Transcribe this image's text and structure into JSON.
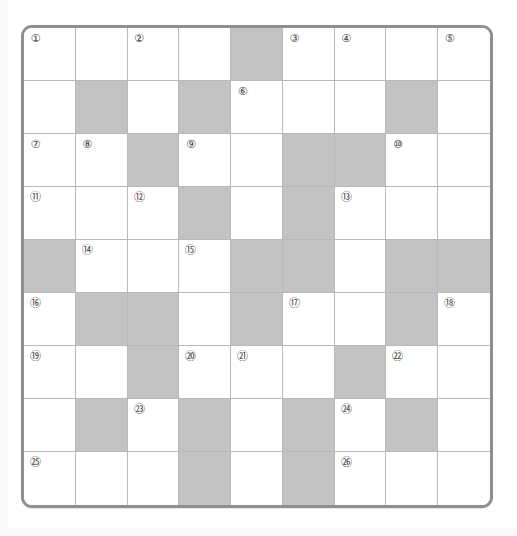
{
  "puzzle": {
    "kind": "crossword-grid",
    "rows": 9,
    "columns": 9,
    "colors": {
      "frame_border": "#8f8f8f",
      "cell_border": "#b9b9b9",
      "open_cell": "#ffffff",
      "blocked_cell": "#c3c3c3",
      "number_text": "#3a3a3a",
      "page_background": "#ffffff"
    },
    "number_style": "circled",
    "highest_clue_number": 26,
    "cells": [
      [
        {
          "state": "open",
          "number": "①"
        },
        {
          "state": "open",
          "number": ""
        },
        {
          "state": "open",
          "number": "②"
        },
        {
          "state": "open",
          "number": ""
        },
        {
          "state": "blocked",
          "number": ""
        },
        {
          "state": "open",
          "number": "③"
        },
        {
          "state": "open",
          "number": "④"
        },
        {
          "state": "open",
          "number": ""
        },
        {
          "state": "open",
          "number": "⑤"
        }
      ],
      [
        {
          "state": "open",
          "number": ""
        },
        {
          "state": "blocked",
          "number": ""
        },
        {
          "state": "open",
          "number": ""
        },
        {
          "state": "blocked",
          "number": ""
        },
        {
          "state": "open",
          "number": "⑥"
        },
        {
          "state": "open",
          "number": ""
        },
        {
          "state": "open",
          "number": ""
        },
        {
          "state": "blocked",
          "number": ""
        },
        {
          "state": "open",
          "number": ""
        }
      ],
      [
        {
          "state": "open",
          "number": "⑦"
        },
        {
          "state": "open",
          "number": "⑧"
        },
        {
          "state": "blocked",
          "number": ""
        },
        {
          "state": "open",
          "number": "⑨"
        },
        {
          "state": "open",
          "number": ""
        },
        {
          "state": "blocked",
          "number": ""
        },
        {
          "state": "blocked",
          "number": ""
        },
        {
          "state": "open",
          "number": "⑩"
        },
        {
          "state": "open",
          "number": ""
        }
      ],
      [
        {
          "state": "open",
          "number": "⑪"
        },
        {
          "state": "open",
          "number": ""
        },
        {
          "state": "open",
          "number": "⑫"
        },
        {
          "state": "blocked",
          "number": ""
        },
        {
          "state": "open",
          "number": ""
        },
        {
          "state": "blocked",
          "number": ""
        },
        {
          "state": "open",
          "number": "⑬"
        },
        {
          "state": "open",
          "number": ""
        },
        {
          "state": "open",
          "number": ""
        }
      ],
      [
        {
          "state": "blocked",
          "number": ""
        },
        {
          "state": "open",
          "number": "⑭"
        },
        {
          "state": "open",
          "number": ""
        },
        {
          "state": "open",
          "number": "⑮"
        },
        {
          "state": "blocked",
          "number": ""
        },
        {
          "state": "blocked",
          "number": ""
        },
        {
          "state": "open",
          "number": ""
        },
        {
          "state": "blocked",
          "number": ""
        },
        {
          "state": "blocked",
          "number": ""
        }
      ],
      [
        {
          "state": "open",
          "number": "⑯"
        },
        {
          "state": "blocked",
          "number": ""
        },
        {
          "state": "blocked",
          "number": ""
        },
        {
          "state": "open",
          "number": ""
        },
        {
          "state": "blocked",
          "number": ""
        },
        {
          "state": "open",
          "number": "⑰"
        },
        {
          "state": "open",
          "number": ""
        },
        {
          "state": "blocked",
          "number": ""
        },
        {
          "state": "open",
          "number": "⑱"
        }
      ],
      [
        {
          "state": "open",
          "number": "⑲"
        },
        {
          "state": "open",
          "number": ""
        },
        {
          "state": "blocked",
          "number": ""
        },
        {
          "state": "open",
          "number": "⑳"
        },
        {
          "state": "open",
          "number": "㉑"
        },
        {
          "state": "open",
          "number": ""
        },
        {
          "state": "blocked",
          "number": ""
        },
        {
          "state": "open",
          "number": "㉒"
        },
        {
          "state": "open",
          "number": ""
        }
      ],
      [
        {
          "state": "open",
          "number": ""
        },
        {
          "state": "blocked",
          "number": ""
        },
        {
          "state": "open",
          "number": "㉓"
        },
        {
          "state": "blocked",
          "number": ""
        },
        {
          "state": "open",
          "number": ""
        },
        {
          "state": "blocked",
          "number": ""
        },
        {
          "state": "open",
          "number": "㉔"
        },
        {
          "state": "blocked",
          "number": ""
        },
        {
          "state": "open",
          "number": ""
        }
      ],
      [
        {
          "state": "open",
          "number": "㉕"
        },
        {
          "state": "open",
          "number": ""
        },
        {
          "state": "open",
          "number": ""
        },
        {
          "state": "blocked",
          "number": ""
        },
        {
          "state": "open",
          "number": ""
        },
        {
          "state": "blocked",
          "number": ""
        },
        {
          "state": "open",
          "number": "㉖"
        },
        {
          "state": "open",
          "number": ""
        },
        {
          "state": "open",
          "number": ""
        }
      ]
    ]
  }
}
